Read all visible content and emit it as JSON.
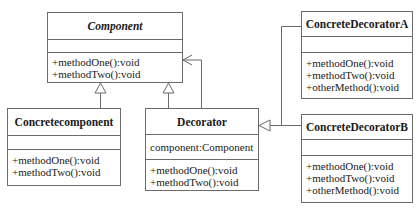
{
  "diagram": {
    "type": "uml-class-diagram",
    "pattern": "Decorator",
    "classes": {
      "component": {
        "name": "Component",
        "abstract": true,
        "attributes": [],
        "methods": [
          "+methodOne():void",
          "+methodTwo():void"
        ]
      },
      "concretecomponent": {
        "name": "Concretecomponent",
        "attributes": [],
        "methods": [
          "+methodOne():void",
          "+methodTwo():void"
        ]
      },
      "decorator": {
        "name": "Decorator",
        "attributes": [
          "component:Component"
        ],
        "methods": [
          "+methodOne():void",
          "+methodTwo():void"
        ]
      },
      "concretedecoratora": {
        "name": "ConcreteDecoratorA",
        "attributes": [],
        "methods": [
          "+methodOne():void",
          "+methodTwo():void",
          "+otherMethod():void"
        ]
      },
      "concretedecoratorb": {
        "name": "ConcreteDecoratorB",
        "attributes": [],
        "methods": [
          "+methodOne():void",
          "+methodTwo():void",
          "+otherMethod():void"
        ]
      }
    },
    "relations": [
      {
        "from": "Concretecomponent",
        "to": "Component",
        "kind": "generalization"
      },
      {
        "from": "Decorator",
        "to": "Component",
        "kind": "generalization"
      },
      {
        "from": "Decorator",
        "to": "Component",
        "kind": "association"
      },
      {
        "from": "ConcreteDecoratorA",
        "to": "Decorator",
        "kind": "generalization"
      },
      {
        "from": "ConcreteDecoratorB",
        "to": "Decorator",
        "kind": "generalization"
      }
    ],
    "colors": {
      "line": "#6b6b6b",
      "text": "#1a1a1a",
      "background": "#ffffff"
    }
  }
}
